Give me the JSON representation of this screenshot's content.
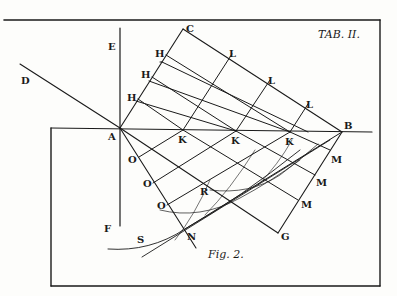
{
  "plate": {
    "title": "TAB. II.",
    "figure_caption": "Fig. 2."
  },
  "labels": {
    "A": "A",
    "B": "B",
    "C": "C",
    "D": "D",
    "E": "E",
    "F": "F",
    "G": "G",
    "N": "N",
    "R": "R",
    "S": "S",
    "H": [
      "H",
      "H",
      "H"
    ],
    "L": [
      "L",
      "L",
      "L"
    ],
    "K": [
      "K",
      "K",
      "K"
    ],
    "M": [
      "M",
      "M",
      "M"
    ],
    "O": [
      "O",
      "O",
      "O"
    ]
  },
  "colors": {
    "ink": "#1a1a1a",
    "paper": "#fdfdfb"
  }
}
